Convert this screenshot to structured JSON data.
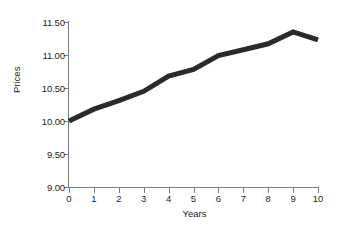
{
  "chart_data": {
    "type": "line",
    "title": "",
    "xlabel": "Years",
    "ylabel": "Prices",
    "x": [
      0,
      1,
      2,
      3,
      4,
      5,
      6,
      7,
      8,
      9,
      10
    ],
    "values": [
      10.0,
      10.18,
      10.31,
      10.45,
      10.68,
      10.78,
      10.99,
      11.08,
      11.17,
      11.35,
      11.23
    ],
    "series": [
      {
        "name": "Prices",
        "values": [
          10.0,
          10.18,
          10.31,
          10.45,
          10.68,
          10.78,
          10.99,
          11.08,
          11.17,
          11.35,
          11.23
        ]
      }
    ],
    "xlim": [
      0,
      10
    ],
    "ylim": [
      9.0,
      11.5
    ],
    "xticks": [
      "0",
      "1",
      "2",
      "3",
      "4",
      "5",
      "6",
      "7",
      "8",
      "9",
      "10"
    ],
    "yticks": [
      "9.00",
      "9.50",
      "10.00",
      "10.50",
      "11.00",
      "11.50"
    ],
    "ytick_values": [
      9.0,
      9.5,
      10.0,
      10.5,
      11.0,
      11.5
    ],
    "grid": false,
    "legend": false,
    "line_color": "#2a2a2a",
    "line_width": 5,
    "axis_color": "#7b7b7b",
    "background_color": "#ffffff"
  }
}
